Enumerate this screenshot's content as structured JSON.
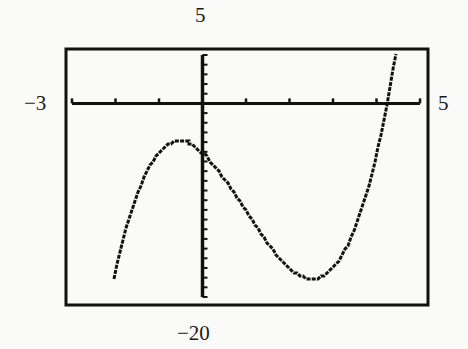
{
  "chart_data": {
    "type": "line",
    "title": "",
    "xlabel": "",
    "ylabel": "",
    "function": "f(x) = x^3 - 3x^2 - 4x - 5",
    "xlim": [
      -3,
      5
    ],
    "ylim": [
      -20,
      5
    ],
    "window_labels": {
      "xmin": "−3",
      "xmax": "5",
      "ymin": "−20",
      "ymax": "5"
    },
    "x_tick_step": 1,
    "y_tick_step": 1,
    "grid": false,
    "legend": null,
    "key_points": [
      {
        "name": "left end of plotted curve",
        "x": -2.05,
        "y": -20
      },
      {
        "name": "local maximum",
        "x": -0.53,
        "y": -3.87
      },
      {
        "name": "y-intercept",
        "x": 0,
        "y": -5
      },
      {
        "name": "local minimum",
        "x": 2.53,
        "y": -18.13
      },
      {
        "name": "x-intercept",
        "x": 4.22,
        "y": 0
      },
      {
        "name": "right end of plotted curve",
        "x": 4.43,
        "y": 5
      }
    ],
    "x": [
      -2.05,
      -2.0,
      -1.5,
      -1.0,
      -0.53,
      0,
      0.5,
      1.0,
      1.5,
      2.0,
      2.53,
      3.0,
      3.5,
      4.0,
      4.22,
      4.43
    ],
    "values": [
      -19.7,
      -17.0,
      -9.13,
      -5.0,
      -3.87,
      -5.0,
      -7.63,
      -11.0,
      -14.38,
      -17.0,
      -18.13,
      -17.0,
      -12.13,
      -5.0,
      0.0,
      5.0
    ]
  },
  "labels": {
    "ymax": "5",
    "ymin": "−20",
    "xmin": "−3",
    "xmax": "5"
  },
  "colors": {
    "ink": "#111111",
    "background": "#fafaf8"
  }
}
